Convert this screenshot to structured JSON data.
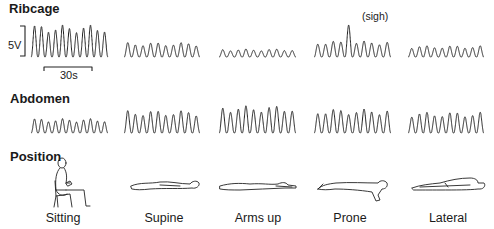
{
  "figure": {
    "rows": {
      "ribcage": "Ribcage",
      "abdomen": "Abdomen",
      "position": "Position"
    },
    "scale": {
      "amplitude": "5V",
      "time": "30s"
    },
    "annotation": "(sigh)",
    "positions": [
      "Sitting",
      "Supine",
      "Arms up",
      "Prone",
      "Lateral"
    ]
  },
  "chart_data": {
    "type": "line",
    "title": "",
    "row_labels": [
      "Ribcage",
      "Abdomen",
      "Position"
    ],
    "columns": [
      "Sitting",
      "Supine",
      "Arms up",
      "Prone",
      "Lateral"
    ],
    "scale_bars": {
      "vertical": "5V",
      "horizontal": "30s"
    },
    "series": [
      {
        "name": "Ribcage",
        "relative_amplitude": [
          1.0,
          0.45,
          0.25,
          0.5,
          0.35
        ],
        "breaths_per_panel": [
          11,
          10,
          10,
          10,
          10
        ],
        "annotation": {
          "column": "Prone",
          "text": "(sigh)"
        }
      },
      {
        "name": "Abdomen",
        "relative_amplitude": [
          0.45,
          0.7,
          0.85,
          0.75,
          0.65
        ],
        "breaths_per_panel": [
          11,
          10,
          10,
          10,
          10
        ]
      }
    ]
  }
}
